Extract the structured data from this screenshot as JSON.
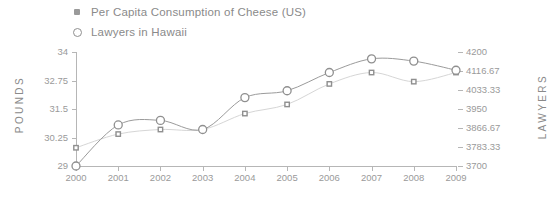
{
  "legend": {
    "items": [
      {
        "label": "Per Capita Consumption of Cheese (US)",
        "marker": "filled-square-marker",
        "color": "#9a9a9a"
      },
      {
        "label": "Lawyers in Hawaii",
        "marker": "hollow-circle-marker",
        "color": "#8f8f8f"
      }
    ]
  },
  "axes": {
    "left_title": "POUNDS",
    "right_title": "LAWYERS",
    "left_ticks": [
      "34",
      "32.75",
      "31.5",
      "30.25",
      "29"
    ],
    "right_ticks": [
      "4200",
      "4116.67",
      "4033.33",
      "3950",
      "3866.67",
      "3783.33",
      "3700"
    ],
    "x_ticks": [
      "2000",
      "2001",
      "2002",
      "2003",
      "2004",
      "2005",
      "2006",
      "2007",
      "2008",
      "2009"
    ]
  },
  "chart_data": {
    "type": "line",
    "title": "",
    "xlabel": "",
    "grid": false,
    "legend_position": "top-left",
    "x": [
      2000,
      2001,
      2002,
      2003,
      2004,
      2005,
      2006,
      2007,
      2008,
      2009
    ],
    "categories": [
      "2000",
      "2001",
      "2002",
      "2003",
      "2004",
      "2005",
      "2006",
      "2007",
      "2008",
      "2009"
    ],
    "series": [
      {
        "name": "Per Capita Consumption of Cheese (US)",
        "axis": "left",
        "unit": "POUNDS",
        "ylim": [
          29,
          34
        ],
        "color": "#9a9a9a",
        "marker": "filled-square-marker",
        "values": [
          29.8,
          30.4,
          30.6,
          30.6,
          31.3,
          31.7,
          32.6,
          33.1,
          32.7,
          33.1
        ]
      },
      {
        "name": "Lawyers in Hawaii",
        "axis": "right",
        "unit": "LAWYERS",
        "ylim": [
          3700,
          4200
        ],
        "color": "#8f8f8f",
        "marker": "hollow-circle-marker",
        "values": [
          3700,
          3880,
          3900,
          3860,
          4000,
          4030,
          4110,
          4170,
          4160,
          4120
        ]
      }
    ]
  }
}
